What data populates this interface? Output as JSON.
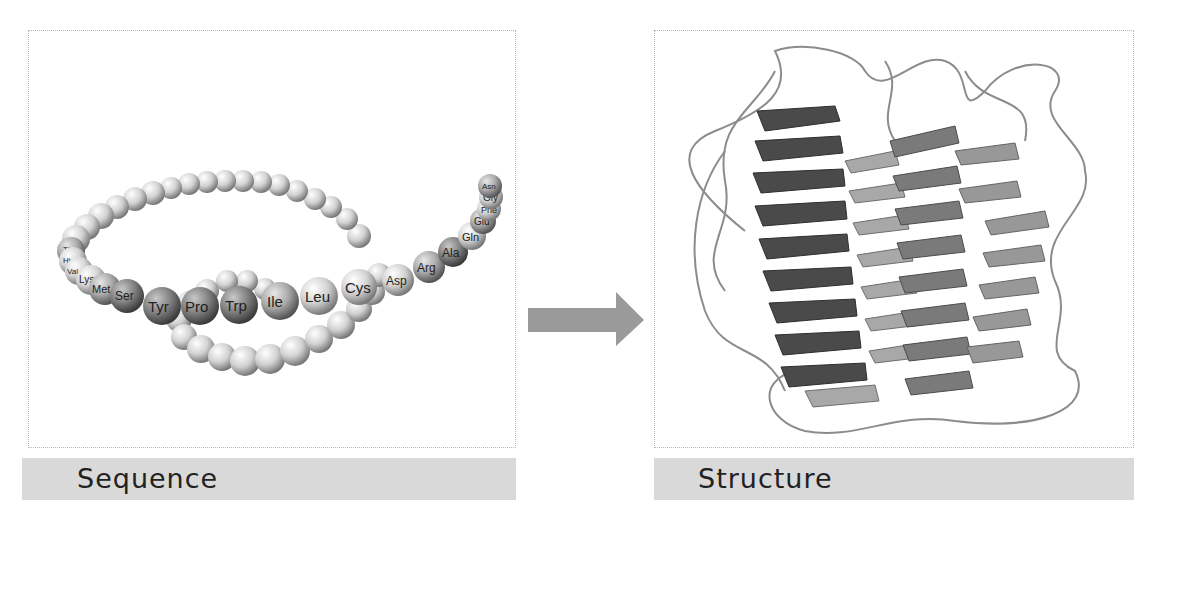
{
  "figure": {
    "left_panel": {
      "caption": "Sequence",
      "residue_labels": [
        "Thr",
        "His",
        "Val",
        "Lys",
        "Met",
        "Ser",
        "Tyr",
        "Pro",
        "Trp",
        "Ile",
        "Leu",
        "Cys",
        "Asp",
        "Arg",
        "Ala",
        "Gln",
        "Glu",
        "Phe",
        "Gly",
        "Asn"
      ]
    },
    "arrow": {
      "direction": "right",
      "color": "#9a9a9a"
    },
    "right_panel": {
      "caption": "Structure"
    },
    "colors": {
      "caption_bg": "#d9d9d9",
      "panel_border": "#b8b8b8",
      "bead_light": "#e0e0e0",
      "bead_dark": "#6a6a6a",
      "helix_dark": "#4a4a4a",
      "helix_mid": "#7a7a7a",
      "helix_light": "#a8a8a8",
      "loop": "#8c8c8c"
    }
  }
}
